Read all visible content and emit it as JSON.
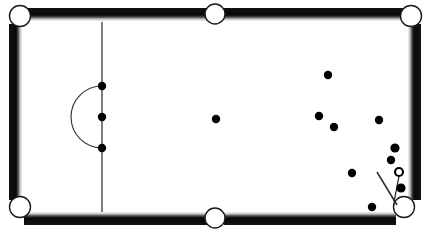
{
  "diagram": {
    "type": "pool-table-top-view",
    "width": 430,
    "height": 234,
    "colors": {
      "cloth": "#ffffff",
      "rail_dark": "#0d0d0d",
      "rail_mid": "#3a3a3a",
      "rail_light": "#b9b9b9",
      "rail_highlight": "#efefef",
      "line": "#3a3a3a",
      "ball_solid": "#000000",
      "ball_cue_fill": "#ffffff",
      "ball_cue_stroke": "#000000",
      "pocket_fill": "#ffffff",
      "pocket_stroke": "#1a1a1a",
      "cue_stick": "#2b2b2b"
    },
    "playfield": {
      "x": 22,
      "y": 22,
      "width": 386,
      "height": 190
    },
    "rail_thickness": 12,
    "pockets": [
      {
        "name": "pocket-top-left",
        "cx": 20,
        "cy": 16,
        "r": 10.5
      },
      {
        "name": "pocket-top-middle",
        "cx": 215,
        "cy": 14,
        "r": 10.0
      },
      {
        "name": "pocket-top-right",
        "cx": 411,
        "cy": 16,
        "r": 10.5
      },
      {
        "name": "pocket-bottom-left",
        "cx": 20,
        "cy": 207,
        "r": 10.5
      },
      {
        "name": "pocket-bottom-middle",
        "cx": 215,
        "cy": 218,
        "r": 10.0
      },
      {
        "name": "pocket-bottom-right",
        "cx": 404,
        "cy": 207,
        "r": 10.5
      }
    ],
    "baulk_line": {
      "name": "baulk-line",
      "x": 102,
      "y1": 22,
      "y2": 212
    },
    "d_arc": {
      "name": "d-semicircle",
      "cx": 102,
      "cy": 117,
      "r": 31,
      "start_y": 86,
      "end_y": 148,
      "bulge": "left"
    },
    "balls": [
      {
        "name": "ball-baulk-top",
        "cx": 102,
        "cy": 86,
        "r": 4.2,
        "kind": "solid"
      },
      {
        "name": "ball-baulk-middle",
        "cx": 102,
        "cy": 117,
        "r": 4.2,
        "kind": "solid"
      },
      {
        "name": "ball-baulk-bottom",
        "cx": 102,
        "cy": 148,
        "r": 4.2,
        "kind": "solid"
      },
      {
        "name": "ball-center",
        "cx": 216,
        "cy": 119,
        "r": 4.2,
        "kind": "solid"
      },
      {
        "name": "ball-upper-right",
        "cx": 328,
        "cy": 75,
        "r": 4.2,
        "kind": "solid"
      },
      {
        "name": "ball-mid-right-a",
        "cx": 319,
        "cy": 116,
        "r": 4.2,
        "kind": "solid"
      },
      {
        "name": "ball-mid-right-b",
        "cx": 334,
        "cy": 127,
        "r": 4.2,
        "kind": "solid"
      },
      {
        "name": "ball-right-rail-a",
        "cx": 379,
        "cy": 120,
        "r": 4.2,
        "kind": "solid"
      },
      {
        "name": "ball-right-rail-b",
        "cx": 395,
        "cy": 148,
        "r": 4.6,
        "kind": "solid"
      },
      {
        "name": "ball-right-rail-c",
        "cx": 391,
        "cy": 160,
        "r": 4.2,
        "kind": "solid"
      },
      {
        "name": "ball-lower-mid",
        "cx": 352,
        "cy": 173,
        "r": 4.2,
        "kind": "solid"
      },
      {
        "name": "ball-near-pocket",
        "cx": 401,
        "cy": 188,
        "r": 4.6,
        "kind": "solid"
      },
      {
        "name": "ball-bottom-rail",
        "cx": 372,
        "cy": 207,
        "r": 4.2,
        "kind": "solid"
      }
    ],
    "cue_ball": {
      "name": "cue-ball",
      "cx": 399,
      "cy": 172,
      "r": 4.0,
      "kind": "hollow"
    },
    "cue_stick": {
      "name": "cue-stick",
      "x1": 377,
      "y1": 172,
      "x2": 397,
      "y2": 205
    },
    "aim_line": {
      "name": "aim-line",
      "x1": 399,
      "y1": 176,
      "x2": 394,
      "y2": 202
    },
    "legend": {
      "solid_label": "object ball",
      "cue_label": "cue ball",
      "stick_label": "cue stick"
    }
  }
}
